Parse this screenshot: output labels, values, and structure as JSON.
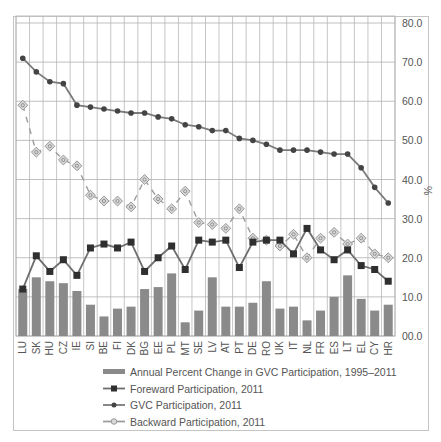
{
  "chart_data": {
    "type": "bar+line",
    "title": "",
    "xlabel": "",
    "ylabel": "%",
    "ylim": [
      0,
      80
    ],
    "yticks": [
      "00.0",
      "10.0",
      "20.0",
      "30.0",
      "40.0",
      "50.0",
      "60.0",
      "70.0",
      "80.0"
    ],
    "grid": true,
    "legend_position": "bottom",
    "categories": [
      "LU",
      "SK",
      "HU",
      "CZ",
      "IE",
      "SI",
      "BE",
      "FI",
      "DK",
      "BG",
      "EE",
      "PL",
      "MT",
      "SE",
      "LV",
      "AT",
      "PT",
      "DE",
      "RO",
      "UK",
      "IT",
      "NL",
      "FR",
      "ES",
      "LT",
      "EL",
      "CY",
      "HR"
    ],
    "series": [
      {
        "name": "Annual Percent Change in GVC Participation, 1995–2011",
        "type": "bar",
        "color": "#8a8a8a",
        "values": [
          12,
          15,
          14,
          13.5,
          11.5,
          8,
          5,
          7,
          7.5,
          12,
          12.5,
          16,
          3.5,
          6.5,
          15,
          7.5,
          7.5,
          8.5,
          14,
          7,
          7.5,
          4,
          6.5,
          10,
          15.5,
          9.5,
          6.5,
          8
        ]
      },
      {
        "name": "Foreward Participation, 2011",
        "type": "line",
        "marker": "square",
        "color": "#3a3a3a",
        "values": [
          12,
          20.5,
          16.5,
          19.5,
          15.5,
          22.5,
          23.5,
          22.5,
          24,
          16.5,
          20,
          23,
          17,
          24.5,
          24,
          24.5,
          17.5,
          24,
          24.5,
          24.5,
          21,
          27.5,
          22,
          19.5,
          22,
          18,
          17,
          14
        ]
      },
      {
        "name": "GVC Participation, 2011",
        "type": "line",
        "marker": "diamond",
        "color": "#555555",
        "values": [
          71,
          67.5,
          65,
          64.5,
          59,
          58.5,
          58,
          57.5,
          57,
          57,
          56,
          55.5,
          54,
          53.5,
          52.5,
          52.5,
          50.5,
          50,
          49,
          47.5,
          47.5,
          47.5,
          47,
          46.5,
          46.5,
          43,
          38,
          34
        ]
      },
      {
        "name": "Backward Participation, 2011",
        "type": "line",
        "dashed": true,
        "marker": "circle-in-square",
        "color": "#9a9a9a",
        "values": [
          59,
          47,
          48.5,
          45,
          43.5,
          36,
          34.5,
          34.5,
          33,
          40,
          35,
          32.5,
          37,
          29,
          28.5,
          27.5,
          32.5,
          25,
          24.5,
          23,
          26,
          20,
          25,
          26.5,
          23.5,
          25,
          21,
          20
        ]
      }
    ]
  },
  "axis": {
    "y_unit": "%"
  },
  "legend": {
    "items": [
      {
        "label": "Annual Percent Change in GVC Participation, 1995–2011",
        "icon": "bar-swatch-icon"
      },
      {
        "label": "Foreward Participation, 2011",
        "icon": "square-marker-line-icon"
      },
      {
        "label": "GVC Participation, 2011",
        "icon": "diamond-marker-line-icon"
      },
      {
        "label": "Backward Participation, 2011",
        "icon": "circle-marker-dashed-line-icon"
      }
    ]
  }
}
